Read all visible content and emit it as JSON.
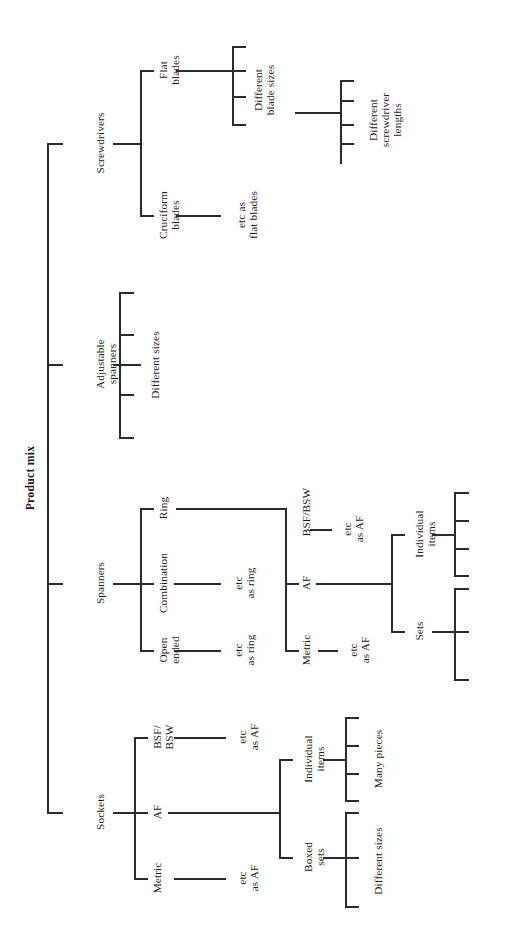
{
  "diagram": {
    "title": "Product mix",
    "type": "hierarchy-tree",
    "orientation": "rotated-90-ccw",
    "root_label": "Product mix",
    "nodes": {
      "sockets": "Sockets",
      "spanners": "Spanners",
      "adjustable_spanners": "Adjustable\nspanners",
      "screwdrivers": "Screwdrivers",
      "sockets_metric": "Metric",
      "sockets_af": "AF",
      "sockets_bsf_bsw": "BSF/\nBSW",
      "sockets_metric_etc": "etc\nas AF",
      "sockets_bsf_etc": "etc\nas AF",
      "sockets_individual_items": "Individual\nitems",
      "sockets_boxed_sets": "Boxed\nsets",
      "sockets_many_pieces": "Many pieces",
      "sockets_different_sizes": "Different sizes",
      "spanners_open_ended": "Open\nended",
      "spanners_combination": "Combination",
      "spanners_ring": "Ring",
      "spanners_open_etc": "etc\nas ring",
      "spanners_comb_etc": "etc\nas ring",
      "spanners_metric": "Metric",
      "spanners_af": "AF",
      "spanners_bsf_bsw": "BSF/BSW",
      "spanners_metric_etc": "etc\nas AF",
      "spanners_bsf_etc": "etc\nas AF",
      "spanners_individual_items": "Individual\nitems",
      "spanners_sets": "Sets",
      "adjustable_different_sizes": "Different sizes",
      "screwdrivers_cruciform": "Cruciform\nblades",
      "screwdrivers_flat": "Flat\nblades",
      "screwdrivers_cruciform_etc": "etc as\nflat blades",
      "screwdrivers_blade_sizes": "Different\nblade sizes",
      "screwdrivers_lengths": "Different\nscrewdriver\nlengths"
    },
    "colors": {
      "line": "#2b2b2b",
      "text": "#1a1a1a",
      "background": "#ffffff"
    }
  }
}
